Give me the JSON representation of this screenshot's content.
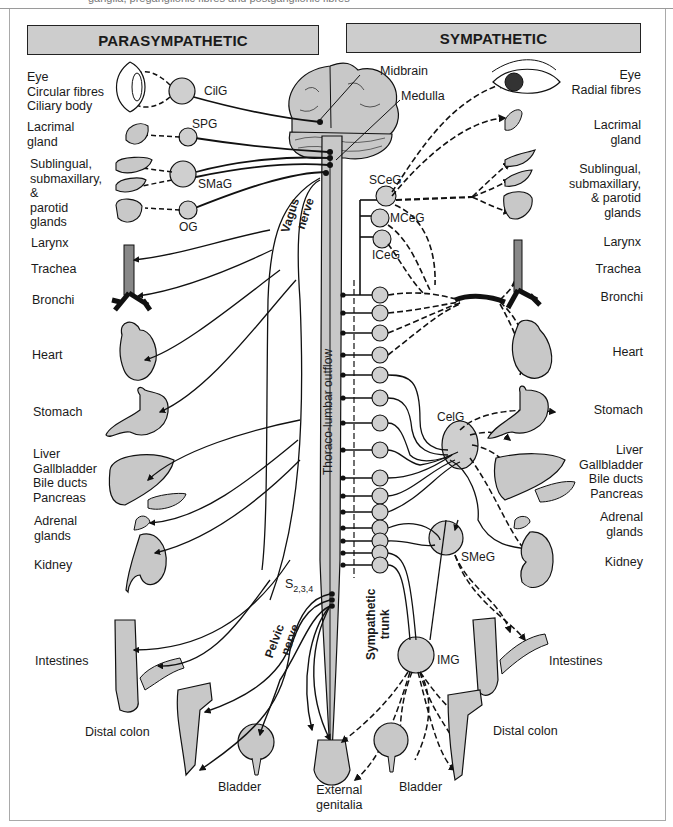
{
  "figure": {
    "top_caption_fragment": "ganglia, preganglionic fibres and postganglionic fibres",
    "headers": {
      "parasympathetic": "PARASYMPATHETIC",
      "sympathetic": "SYMPATHETIC"
    },
    "colors": {
      "header_fill": "#cdcdcd",
      "organ_fill": "#c8c8c8",
      "ganglion_fill": "#cfcfcf",
      "line": "#111111",
      "frame": "#a9a9a9"
    },
    "parasympathetic_organs": [
      {
        "id": "eye",
        "lines": [
          "Eye",
          "Circular fibres",
          "Ciliary body"
        ]
      },
      {
        "id": "lacrimal",
        "lines": [
          "Lacrimal",
          "gland"
        ]
      },
      {
        "id": "salivary",
        "lines": [
          "Sublingual,",
          "submaxillary,",
          "&",
          "parotid",
          "glands"
        ]
      },
      {
        "id": "larynx",
        "lines": [
          "Larynx"
        ]
      },
      {
        "id": "trachea",
        "lines": [
          "Trachea"
        ]
      },
      {
        "id": "bronchi",
        "lines": [
          "Bronchi"
        ]
      },
      {
        "id": "heart",
        "lines": [
          "Heart"
        ]
      },
      {
        "id": "stomach",
        "lines": [
          "Stomach"
        ]
      },
      {
        "id": "liver",
        "lines": [
          "Liver",
          "Gallbladder",
          "Bile ducts",
          "Pancreas"
        ]
      },
      {
        "id": "adrenal",
        "lines": [
          "Adrenal",
          "glands"
        ]
      },
      {
        "id": "kidney",
        "lines": [
          "Kidney"
        ]
      },
      {
        "id": "intestines",
        "lines": [
          "Intestines"
        ]
      },
      {
        "id": "distal_colon",
        "lines": [
          "Distal colon"
        ]
      },
      {
        "id": "bladder",
        "lines": [
          "Bladder"
        ]
      }
    ],
    "sympathetic_organs": [
      {
        "id": "eye",
        "lines": [
          "Eye",
          "Radial fibres"
        ]
      },
      {
        "id": "lacrimal",
        "lines": [
          "Lacrimal",
          "gland"
        ]
      },
      {
        "id": "salivary",
        "lines": [
          "Sublingual,",
          "submaxillary,",
          "& parotid",
          "glands"
        ]
      },
      {
        "id": "larynx",
        "lines": [
          "Larynx"
        ]
      },
      {
        "id": "trachea",
        "lines": [
          "Trachea"
        ]
      },
      {
        "id": "bronchi",
        "lines": [
          "Bronchi"
        ]
      },
      {
        "id": "heart",
        "lines": [
          "Heart"
        ]
      },
      {
        "id": "stomach",
        "lines": [
          "Stomach"
        ]
      },
      {
        "id": "liver",
        "lines": [
          "Liver",
          "Gallbladder",
          "Bile ducts",
          "Pancreas"
        ]
      },
      {
        "id": "adrenal",
        "lines": [
          "Adrenal",
          "glands"
        ]
      },
      {
        "id": "kidney",
        "lines": [
          "Kidney"
        ]
      },
      {
        "id": "intestines",
        "lines": [
          "Intestines"
        ]
      },
      {
        "id": "distal_colon",
        "lines": [
          "Distal colon"
        ]
      },
      {
        "id": "bladder",
        "lines": [
          "Bladder"
        ]
      }
    ],
    "shared_organs": {
      "external_genitalia": [
        "External",
        "genitalia"
      ]
    },
    "cns": {
      "midbrain": "Midbrain",
      "medulla": "Medulla",
      "thoraco_lumbar": "Thoraco-lumbar outflow",
      "sacral": "S",
      "sacral_sub": "2,3,4"
    },
    "nerves": {
      "vagus": [
        "Vagus",
        "nerve"
      ],
      "pelvic": [
        "Pelvic",
        "nerve"
      ],
      "sympathetic_trunk": [
        "Sympathetic",
        "trunk"
      ]
    },
    "ganglia": {
      "parasympathetic": [
        "CilG",
        "SPG",
        "SMaG",
        "OG"
      ],
      "sympathetic": [
        "SCeG",
        "MCeG",
        "ICeG",
        "CelG",
        "SMeG",
        "IMG"
      ]
    }
  }
}
